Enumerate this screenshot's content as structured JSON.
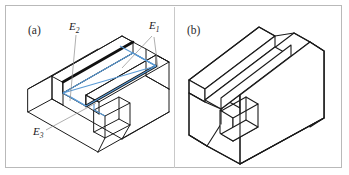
{
  "figure": {
    "border_color": "#b9b9b9",
    "background": "#ffffff",
    "ink_color": "#1a1a1a",
    "highlight_color": "#5b9bd5",
    "leader_color": "#8d8d8d"
  },
  "panels": [
    {
      "id": "a",
      "caption": "(a)",
      "description": "wireframe isometric block with rectangular groove and notch",
      "labels": [
        {
          "name": "E2",
          "base": "E",
          "sub": "2",
          "x": 63,
          "y": 24
        },
        {
          "name": "E1",
          "base": "E",
          "sub": "1",
          "x": 143,
          "y": 23
        },
        {
          "name": "E3",
          "base": "E",
          "sub": "3",
          "x": 27,
          "y": 129
        }
      ]
    },
    {
      "id": "b",
      "caption": "(b)",
      "description": "solid shaded isometric block with groove and notch, hidden edges removed"
    }
  ]
}
